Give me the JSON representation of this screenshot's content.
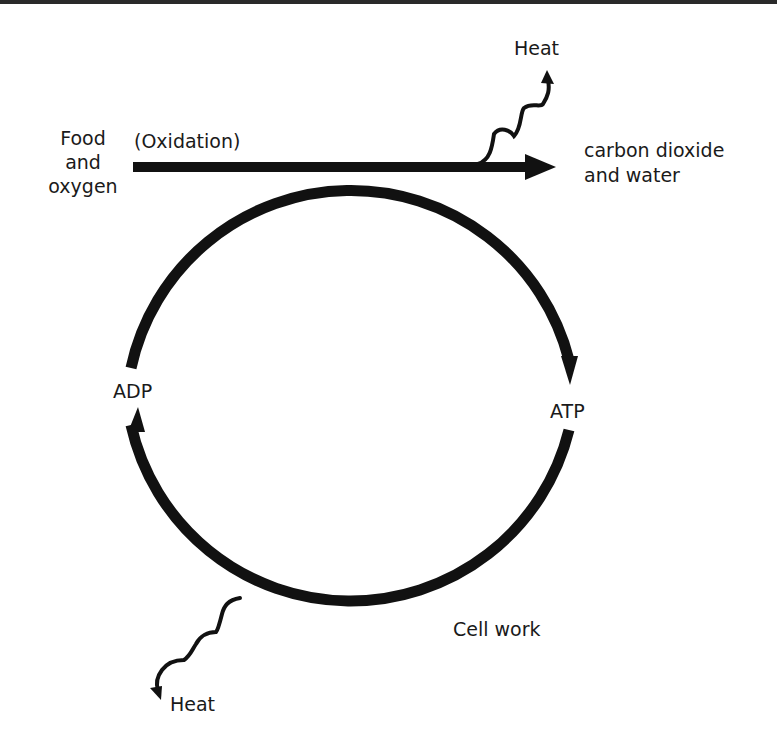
{
  "diagram": {
    "type": "cycle",
    "colors": {
      "stroke": "#111111",
      "text": "#1a1a1a",
      "background": "#ffffff",
      "top_rule": "#2a2a2a"
    },
    "input": {
      "line1": "Food",
      "line2": "and",
      "line3": "oxygen"
    },
    "process_label": "(Oxidation)",
    "output": {
      "line1": "carbon dioxide",
      "line2": "and water"
    },
    "heat_top": "Heat",
    "heat_bottom": "Heat",
    "cycle_nodes": {
      "left": "ADP",
      "right": "ATP"
    },
    "cell_work": "Cell work"
  }
}
